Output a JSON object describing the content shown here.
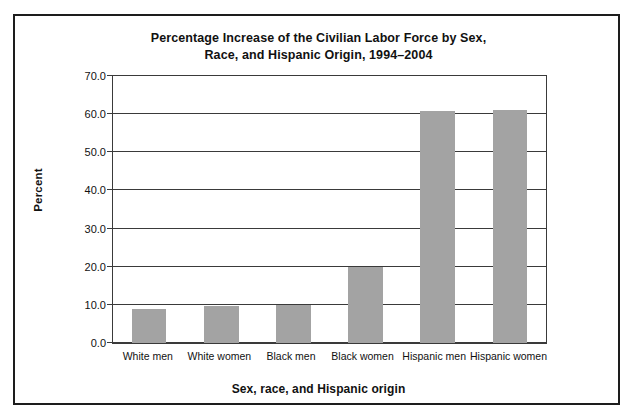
{
  "chart_data": {
    "type": "bar",
    "title": "Percentage Increase of the Civilian Labor Force by Sex, Race, and Hispanic Origin, 1994–2004",
    "title_lines": [
      "Percentage Increase of the Civilian Labor Force by Sex,",
      "Race, and Hispanic Origin, 1994–2004"
    ],
    "xlabel": "Sex, race, and Hispanic origin",
    "ylabel": "Percent",
    "categories": [
      "White men",
      "White women",
      "Black men",
      "Black women",
      "Hispanic men",
      "Hispanic women"
    ],
    "values": [
      8.8,
      9.7,
      9.9,
      19.8,
      60.7,
      61.2
    ],
    "ylim": [
      0.0,
      70.0
    ],
    "ytick_step": 10.0,
    "ytick_labels": [
      "0.0",
      "10.0",
      "20.0",
      "30.0",
      "40.0",
      "50.0",
      "60.0",
      "70.0"
    ],
    "ytick_values": [
      0.0,
      10.0,
      20.0,
      30.0,
      40.0,
      50.0,
      60.0,
      70.0
    ],
    "grid": true,
    "legend": false,
    "bar_color": "#a3a3a3",
    "axis_color": "#3a3a3a",
    "frame_color": "#1d1d1d",
    "background": "#ffffff"
  }
}
